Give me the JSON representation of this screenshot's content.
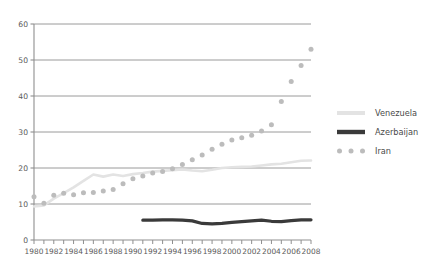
{
  "chart_data": {
    "type": "line",
    "title": "",
    "subtitle": "",
    "xlabel": "",
    "ylabel": "",
    "xlim": [
      1980,
      2008
    ],
    "ylim": [
      0,
      60
    ],
    "grid": true,
    "grid_axis": "y",
    "legend_position": "right",
    "x": [
      1980,
      1981,
      1982,
      1983,
      1984,
      1985,
      1986,
      1987,
      1988,
      1989,
      1990,
      1991,
      1992,
      1993,
      1994,
      1995,
      1996,
      1997,
      1998,
      1999,
      2000,
      2001,
      2002,
      2003,
      2004,
      2005,
      2006,
      2007,
      2008
    ],
    "x_tick_labels": [
      "1980",
      "1982",
      "1984",
      "1986",
      "1988",
      "1990",
      "1992",
      "1994",
      "1996",
      "1998",
      "2000",
      "2002",
      "2004",
      "2006",
      "2008"
    ],
    "y_tick_labels": [
      "0",
      "10",
      "20",
      "30",
      "40",
      "50",
      "60"
    ],
    "y_ticks": [
      0,
      10,
      20,
      30,
      40,
      50,
      60
    ],
    "series": [
      {
        "name": "Venezuela",
        "color": "#e3e3e3",
        "style": "line",
        "values": [
          9.3,
          9.6,
          11.5,
          13.0,
          14.6,
          16.4,
          18.2,
          17.6,
          18.2,
          17.8,
          18.3,
          18.6,
          19.0,
          19.2,
          19.4,
          19.6,
          19.3,
          19.1,
          19.5,
          20.0,
          20.2,
          20.3,
          20.4,
          20.7,
          21.0,
          21.2,
          21.6,
          22.0,
          22.1
        ]
      },
      {
        "name": "Azerbaijan",
        "color": "#3a3a3a",
        "style": "line",
        "values": [
          null,
          null,
          null,
          null,
          null,
          null,
          null,
          null,
          null,
          null,
          null,
          5.5,
          5.5,
          5.6,
          5.6,
          5.5,
          5.3,
          4.6,
          4.5,
          4.6,
          4.9,
          5.1,
          5.3,
          5.5,
          5.2,
          5.1,
          5.4,
          5.6,
          5.6
        ]
      },
      {
        "name": "Iran",
        "color": "#bcbcbc",
        "style": "dots",
        "values": [
          12.0,
          10.2,
          12.4,
          13.0,
          12.6,
          13.1,
          13.2,
          13.6,
          14.0,
          15.6,
          17.0,
          17.8,
          18.6,
          19.0,
          19.8,
          21.0,
          22.3,
          23.6,
          25.2,
          26.6,
          27.8,
          28.4,
          29.1,
          30.3,
          32.0,
          38.5,
          44.0,
          48.5,
          53.0
        ]
      }
    ]
  },
  "legend": {
    "items": [
      {
        "label": "Venezuela",
        "marker": "line-light"
      },
      {
        "label": "Azerbaijan",
        "marker": "line-dark"
      },
      {
        "label": "Iran",
        "marker": "dots"
      }
    ]
  },
  "axes": {
    "axis_color": "#8f8f8f",
    "grid_color": "#8f8f8f"
  }
}
